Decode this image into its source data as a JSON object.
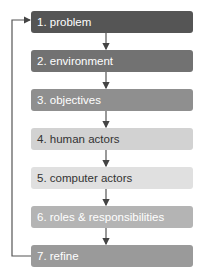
{
  "diagram": {
    "title": "",
    "steps": [
      {
        "label": "1. problem",
        "bg": "#555555",
        "fg": "#ffffff",
        "top": 11
      },
      {
        "label": "2. environment",
        "bg": "#727272",
        "fg": "#ffffff",
        "top": 50
      },
      {
        "label": "3. objectives",
        "bg": "#8f8f8f",
        "fg": "#ffffff",
        "top": 89
      },
      {
        "label": "4. human actors",
        "bg": "#d2d2d2",
        "fg": "#333333",
        "top": 128
      },
      {
        "label": "5. computer actors",
        "bg": "#e0e0e0",
        "fg": "#333333",
        "top": 167
      },
      {
        "label": "6. roles & responsibilities",
        "bg": "#b4b4b4",
        "fg": "#ffffff",
        "top": 206
      },
      {
        "label": "7. refine",
        "bg": "#9a9a9a",
        "fg": "#ffffff",
        "top": 245
      }
    ],
    "feedback_loop": {
      "from": "7. refine",
      "to": "1. problem"
    },
    "line_color": "#555555"
  }
}
